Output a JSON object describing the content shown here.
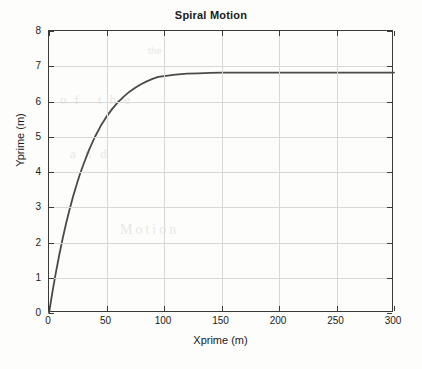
{
  "figure": {
    "title": "Spiral Motion",
    "background_color": "#fdfdfc",
    "axis_color": "#3a3a3a",
    "grid_color": "#d8d8d8",
    "curve_color": "#4a4a4a"
  },
  "axes": {
    "xlabel": "Xprime (m)",
    "ylabel": "Yprime (m)",
    "xticklabels": [
      "0",
      "50",
      "100",
      "150",
      "200",
      "250",
      "300"
    ],
    "yticklabels": [
      "0",
      "1",
      "2",
      "3",
      "4",
      "5",
      "6",
      "7",
      "8"
    ]
  },
  "bleed_text": {
    "line1": "the",
    "line2": "of the",
    "line3": "and",
    "line4": "Motion"
  },
  "chart_data": {
    "type": "line",
    "title": "Spiral Motion",
    "xlabel": "Xprime (m)",
    "ylabel": "Yprime (m)",
    "xlim": [
      0,
      300
    ],
    "ylim": [
      0,
      8
    ],
    "xticks": [
      0,
      50,
      100,
      150,
      200,
      250,
      300
    ],
    "yticks": [
      0,
      1,
      2,
      3,
      4,
      5,
      6,
      7,
      8
    ],
    "grid": true,
    "legend": null,
    "asymptote": 6.82,
    "series": [
      {
        "name": "Spiral trajectory",
        "color": "#4a4a4a",
        "linewidth": 1.8,
        "x": [
          0,
          3,
          6,
          9,
          12,
          15,
          18,
          21,
          24,
          27,
          30,
          35,
          40,
          45,
          50,
          55,
          60,
          65,
          70,
          75,
          80,
          85,
          90,
          95,
          100,
          110,
          120,
          130,
          140,
          150,
          160,
          170,
          180,
          190,
          200,
          210,
          220,
          230,
          240,
          250,
          260,
          270,
          280,
          290,
          300
        ],
        "y": [
          0.0,
          0.6,
          1.15,
          1.66,
          2.13,
          2.56,
          2.95,
          3.31,
          3.64,
          3.95,
          4.22,
          4.64,
          5.0,
          5.31,
          5.57,
          5.79,
          5.98,
          6.14,
          6.28,
          6.39,
          6.49,
          6.57,
          6.64,
          6.7,
          6.72,
          6.76,
          6.79,
          6.8,
          6.81,
          6.82,
          6.82,
          6.82,
          6.82,
          6.82,
          6.82,
          6.82,
          6.82,
          6.82,
          6.82,
          6.82,
          6.82,
          6.82,
          6.82,
          6.82,
          6.82
        ]
      }
    ]
  }
}
